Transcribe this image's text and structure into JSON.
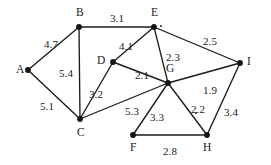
{
  "figure": {
    "kind": "weighted-undirected-graph",
    "width": 271,
    "height": 165,
    "background": "#ffffff",
    "ink_color": "#1a1a1a"
  },
  "chart_data": {
    "type": "diagram",
    "title": "",
    "xlabel": "",
    "ylabel": "",
    "nodes": [
      {
        "id": "A",
        "label": "A",
        "x": 28,
        "y": 70,
        "label_dx": -12,
        "label_dy": -6
      },
      {
        "id": "B",
        "label": "B",
        "x": 79,
        "y": 27,
        "label_dx": -3,
        "label_dy": -20
      },
      {
        "id": "C",
        "label": "C",
        "x": 80,
        "y": 119,
        "label_dx": -3,
        "label_dy": 8
      },
      {
        "id": "D",
        "label": "D",
        "x": 113,
        "y": 62,
        "label_dx": -16,
        "label_dy": -7
      },
      {
        "id": "E",
        "label": "E",
        "x": 154,
        "y": 27,
        "label_dx": -3,
        "label_dy": -20
      },
      {
        "id": "F",
        "label": "F",
        "x": 133,
        "y": 135,
        "label_dx": -3,
        "label_dy": 7
      },
      {
        "id": "G",
        "label": "G",
        "x": 168,
        "y": 83,
        "label_dx": -2,
        "label_dy": -20
      },
      {
        "id": "H",
        "label": "H",
        "x": 207,
        "y": 135,
        "label_dx": -4,
        "label_dy": 7
      },
      {
        "id": "I",
        "label": "I",
        "x": 240,
        "y": 63,
        "label_dx": 7,
        "label_dy": -7
      }
    ],
    "edges": [
      {
        "from": "A",
        "to": "B",
        "weight": "4.7",
        "label_x": 44,
        "label_y": 39
      },
      {
        "from": "A",
        "to": "C",
        "weight": "5.1",
        "label_x": 40,
        "label_y": 101
      },
      {
        "from": "B",
        "to": "C",
        "weight": "5.4",
        "label_x": 59,
        "label_y": 68
      },
      {
        "from": "B",
        "to": "E",
        "weight": "3.1",
        "label_x": 110,
        "label_y": 13
      },
      {
        "from": "D",
        "to": "E",
        "weight": "4.1",
        "label_x": 119,
        "label_y": 41
      },
      {
        "from": "D",
        "to": "C",
        "weight": "3.2",
        "label_x": 89,
        "label_y": 89
      },
      {
        "from": "D",
        "to": "G",
        "weight": "2.1",
        "label_x": 135,
        "label_y": 70
      },
      {
        "from": "E",
        "to": "G",
        "weight": "2.3",
        "label_x": 166,
        "label_y": 52
      },
      {
        "from": "E",
        "to": "I",
        "weight": "2.5",
        "label_x": 203,
        "label_y": 36
      },
      {
        "from": "C",
        "to": "G",
        "weight": "5.3",
        "label_x": 125,
        "label_y": 106
      },
      {
        "from": "G",
        "to": "I",
        "weight": "1.9",
        "label_x": 203,
        "label_y": 85
      },
      {
        "from": "G",
        "to": "F",
        "weight": "3.3",
        "label_x": 150,
        "label_y": 112
      },
      {
        "from": "G",
        "to": "H",
        "weight": "2.2",
        "label_x": 191,
        "label_y": 104
      },
      {
        "from": "H",
        "to": "I",
        "weight": "3.4",
        "label_x": 224,
        "label_y": 107
      },
      {
        "from": "F",
        "to": "H",
        "weight": "2.8",
        "label_x": 163,
        "label_y": 146
      }
    ],
    "artifacts": [
      {
        "name": "speck-near-e",
        "x": 160,
        "y": 25
      },
      {
        "name": "speck-near-gh",
        "x": 195,
        "y": 112
      }
    ]
  }
}
